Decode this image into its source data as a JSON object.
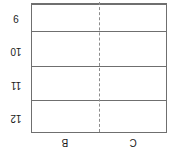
{
  "figure": {
    "orientation": "rotated-180",
    "frame_color": "#6f6f6f",
    "divider_color": "#8d8d8d",
    "background_color": "#ffffff",
    "text_color": "#1a1a1a"
  },
  "row_labels": [
    {
      "text": "12"
    },
    {
      "text": "11"
    },
    {
      "text": "10"
    },
    {
      "text": "9"
    }
  ],
  "column_labels": [
    {
      "text": "B"
    },
    {
      "text": "C"
    }
  ],
  "cells": [
    {
      "text": ""
    },
    {
      "text": ""
    },
    {
      "text": ""
    },
    {
      "text": ""
    },
    {
      "text": ""
    },
    {
      "text": ""
    },
    {
      "text": ""
    },
    {
      "text": ""
    }
  ]
}
